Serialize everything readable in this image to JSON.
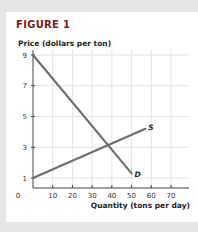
{
  "figure": {
    "title": "FIGURE 1",
    "y_axis_label": "Price (dollars per ton)",
    "x_axis_label": "Quantity (tons per day)",
    "origin_label": "0"
  },
  "chart_data": {
    "type": "line",
    "title": "FIGURE 1",
    "xlabel": "Quantity (tons per day)",
    "ylabel": "Price (dollars per ton)",
    "xlim": [
      0,
      75
    ],
    "ylim": [
      0,
      9
    ],
    "x_ticks": [
      10,
      20,
      30,
      40,
      50,
      60,
      70
    ],
    "y_ticks": [
      1,
      3,
      5,
      7,
      9
    ],
    "grid": true,
    "series": [
      {
        "name": "D",
        "label": "D",
        "points": [
          [
            0,
            9
          ],
          [
            50,
            1.3
          ]
        ]
      },
      {
        "name": "S",
        "label": "S",
        "points": [
          [
            0,
            1
          ],
          [
            57,
            4.2
          ]
        ]
      }
    ],
    "annotations": [
      {
        "text": "Equilibrium intersection",
        "x": 40,
        "y": 3
      }
    ]
  }
}
